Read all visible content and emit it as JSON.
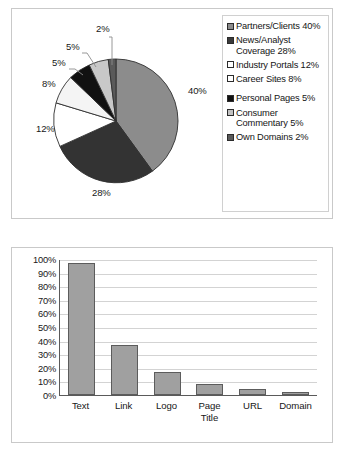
{
  "pie_panel": {
    "name": "Where company mentions appear",
    "legend": {
      "items": [
        {
          "label": "Partners/Clients 40%",
          "color": "#8c8c8c",
          "swatch_name": "legend-swatch-partners-clients"
        },
        {
          "label": "News/Analyst Coverage 28%",
          "color": "#3a3a3a",
          "swatch_name": "legend-swatch-news-analyst-coverage"
        },
        {
          "label": "Industry Portals 12%",
          "color": "#ffffff",
          "swatch_name": "legend-swatch-industry-portals"
        },
        {
          "label": "Career Sites 8%",
          "color": "#ffffff",
          "swatch_name": "legend-swatch-career-sites"
        },
        {
          "label": "Personal Pages 5%",
          "color": "#111111",
          "swatch_name": "legend-swatch-personal-pages"
        },
        {
          "label": "Consumer Commentary 5%",
          "color": "#c2c2c2",
          "swatch_name": "legend-swatch-consumer-commentary"
        },
        {
          "label": "Own Domains 2%",
          "color": "#5a5a5a",
          "swatch_name": "legend-swatch-own-domains"
        }
      ]
    },
    "data_labels": [
      {
        "text": "40%",
        "x": 176,
        "y": 82
      },
      {
        "text": "28%",
        "x": 83,
        "y": 182
      },
      {
        "text": "12%",
        "x": 27,
        "y": 120
      },
      {
        "text": "8%",
        "x": 31,
        "y": 76
      },
      {
        "text": "5%",
        "x": 41,
        "y": 54
      },
      {
        "text": "5%",
        "x": 56,
        "y": 36
      },
      {
        "text": "2%",
        "x": 86,
        "y": 19
      }
    ]
  },
  "bar_panel": {
    "name": "Content type frequency"
  },
  "chart_data": [
    {
      "type": "pie",
      "title": "",
      "legend_position": "right",
      "categories": [
        "Partners/Clients",
        "News/Analyst Coverage",
        "Industry Portals",
        "Career Sites",
        "Personal Pages",
        "Consumer Commentary",
        "Own Domains"
      ],
      "values": [
        40,
        28,
        12,
        8,
        5,
        5,
        2
      ],
      "value_labels": [
        "40%",
        "28%",
        "12%",
        "8%",
        "5%",
        "5%",
        "2%"
      ],
      "colors": [
        "#8c8c8c",
        "#3a3a3a",
        "#ffffff",
        "#f2f2f2",
        "#111111",
        "#c2c2c2",
        "#5a5a5a"
      ],
      "units": "percent"
    },
    {
      "type": "bar",
      "title": "",
      "xlabel": "",
      "ylabel": "",
      "categories": [
        "Text",
        "Link",
        "Logo",
        "Page Title",
        "URL",
        "Domain"
      ],
      "values": [
        97,
        37,
        17,
        8,
        4.5,
        2
      ],
      "ylim": [
        0,
        100
      ],
      "ytick_labels": [
        "100%",
        "90%",
        "80%",
        "70%",
        "60%",
        "50%",
        "40%",
        "30%",
        "20%",
        "10%",
        "0%"
      ],
      "ytick_values": [
        100,
        90,
        80,
        70,
        60,
        50,
        40,
        30,
        20,
        10,
        0
      ],
      "grid": true,
      "bar_color": "#a0a0a0",
      "bar_border_color": "#5c5c5c"
    }
  ]
}
